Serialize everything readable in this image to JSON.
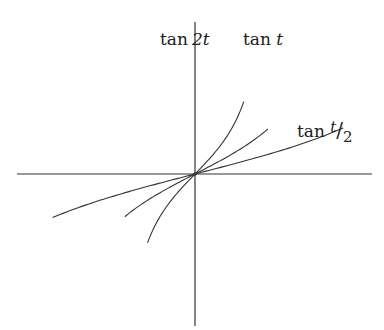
{
  "figure": {
    "axes": {
      "origin_px": [
        195,
        174
      ],
      "x_axis_px": [
        17,
        372
      ],
      "y_axis_px": [
        22,
        326
      ],
      "color": "#333333"
    },
    "labels": {
      "tan2t": {
        "func": "tan",
        "arg": "2t"
      },
      "tant": {
        "func": "tan",
        "arg": "t"
      },
      "tanhalf": {
        "func": "tan",
        "num": "t",
        "slash": "/",
        "den": "2"
      }
    },
    "curve_color": "#333333"
  },
  "chart_data": {
    "type": "line",
    "title": "",
    "xlabel": "t",
    "ylabel": "",
    "grid": false,
    "legend": "inline labels",
    "series": [
      {
        "name": "tan 2t",
        "k": 2.0,
        "t_range": [
          -0.73,
          0.75
        ]
      },
      {
        "name": "tan t",
        "k": 1.0,
        "t_range": [
          -1.08,
          1.12
        ]
      },
      {
        "name": "tan t/2",
        "k": 0.5,
        "t_range": [
          -2.19,
          2.28
        ]
      }
    ],
    "scale": {
      "x_px_per_unit": 65,
      "y_px_per_unit": 54
    }
  }
}
